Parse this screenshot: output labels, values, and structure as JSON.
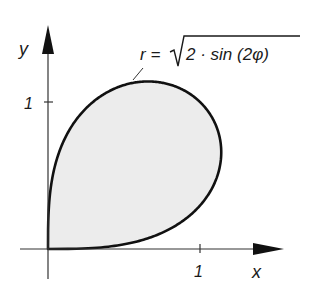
{
  "figure": {
    "formula": {
      "lhs": "r =",
      "radicand": "2 · sin (2φ)"
    },
    "x_axis": {
      "label": "x",
      "tick_label": "1"
    },
    "y_axis": {
      "label": "y",
      "tick_label": "1"
    },
    "colors": {
      "curve": "#111111",
      "fill": "#ececec",
      "axis": "#333333"
    }
  },
  "chart_data": {
    "type": "line",
    "xlabel": "x",
    "ylabel": "y",
    "x_ticks": [
      1
    ],
    "y_ticks": [
      1
    ],
    "xlim": [
      -0.18,
      1.55
    ],
    "ylim": [
      -0.2,
      1.53
    ],
    "grid": false,
    "series": [
      {
        "name": "r = sqrt(2 sin(2φ))",
        "points": [
          [
            0,
            0
          ],
          [
            0.264,
            0.005
          ],
          [
            0.373,
            0.013
          ],
          [
            0.457,
            0.024
          ],
          [
            0.587,
            0.051
          ],
          [
            0.815,
            0.144
          ],
          [
            0.966,
            0.259
          ],
          [
            1.065,
            0.388
          ],
          [
            1.122,
            0.523
          ],
          [
            1.14,
            0.658
          ],
          [
            1.123,
            0.786
          ],
          [
            1.075,
            0.902
          ],
          [
            1.0,
            1.0
          ],
          [
            0.902,
            1.075
          ],
          [
            0.786,
            1.123
          ],
          [
            0.658,
            1.14
          ],
          [
            0.523,
            1.122
          ],
          [
            0.388,
            1.065
          ],
          [
            0.259,
            0.966
          ],
          [
            0.144,
            0.815
          ],
          [
            0.051,
            0.587
          ],
          [
            0.024,
            0.457
          ],
          [
            0.013,
            0.373
          ],
          [
            0.005,
            0.264
          ],
          [
            0,
            0
          ]
        ]
      }
    ]
  }
}
